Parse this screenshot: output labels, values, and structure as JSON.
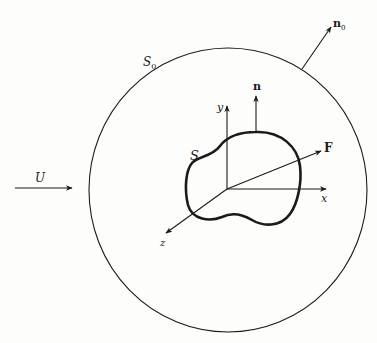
{
  "figure": {
    "labels": {
      "outer_surface": "S",
      "outer_surface_sub": "0",
      "body_surface": "S",
      "outer_normal": "n",
      "outer_normal_sub": "0",
      "body_normal": "n",
      "force": "F",
      "free_stream": "U",
      "axis_x": "x",
      "axis_y": "y",
      "axis_z": "z"
    },
    "colors": {
      "ink": "#1a1a1a",
      "paper": "#fdfdfb"
    }
  }
}
